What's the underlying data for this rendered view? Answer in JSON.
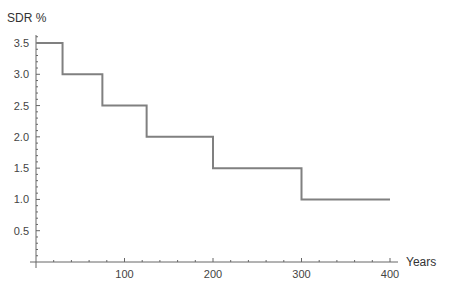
{
  "chart_data": {
    "type": "line",
    "subtype": "step",
    "title": "",
    "xlabel": "Years",
    "ylabel": "SDR %",
    "xlim": [
      0,
      400
    ],
    "ylim": [
      0,
      3.5
    ],
    "x_ticks": [
      100,
      200,
      300,
      400
    ],
    "y_ticks": [
      0.5,
      1.0,
      1.5,
      2.0,
      2.5,
      3.0,
      3.5
    ],
    "x_tick_labels": [
      "100",
      "200",
      "300",
      "400"
    ],
    "y_tick_labels": [
      "0.5",
      "1.0",
      "1.5",
      "2.0",
      "2.5",
      "3.0",
      "3.5"
    ],
    "grid": false,
    "legend": null,
    "series": [
      {
        "name": "SDR",
        "color": "#808080",
        "steps": [
          {
            "x_start": 0,
            "x_end": 30,
            "value": 3.5
          },
          {
            "x_start": 30,
            "x_end": 75,
            "value": 3.0
          },
          {
            "x_start": 75,
            "x_end": 125,
            "value": 2.5
          },
          {
            "x_start": 125,
            "x_end": 200,
            "value": 2.0
          },
          {
            "x_start": 200,
            "x_end": 300,
            "value": 1.5
          },
          {
            "x_start": 300,
            "x_end": 400,
            "value": 1.0
          }
        ]
      }
    ]
  },
  "colors": {
    "line": "#808080",
    "axis": "#666666"
  }
}
